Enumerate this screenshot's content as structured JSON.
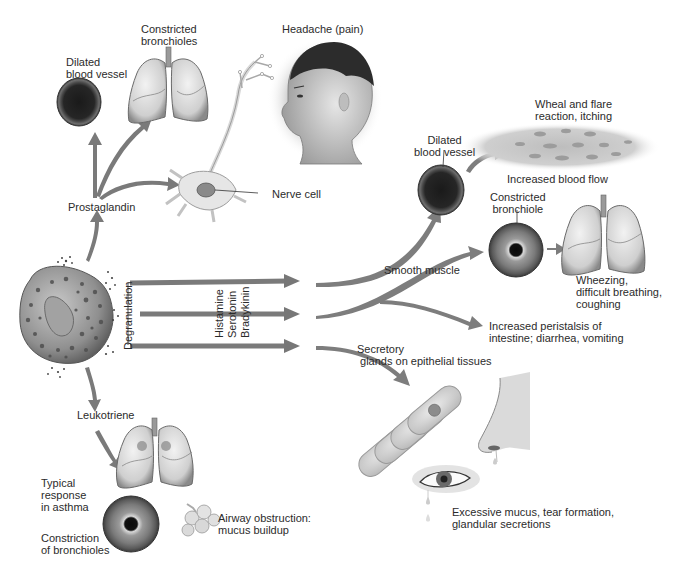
{
  "diagram": {
    "palette": {
      "arrow": "#7a7a7a",
      "arrow_dark": "#5e5e5e",
      "label_text": "#2b2b2b",
      "tissue_light": "#d9d9d9",
      "tissue_mid": "#a8a8a8",
      "tissue_dark": "#3c3c3c",
      "background": "#ffffff"
    },
    "source_cell": {
      "name": "Mast cell (granulated)",
      "process_label": "Degranulation"
    },
    "mediators": {
      "prostaglandin": "Prostaglandin",
      "leukotriene": "Leukotriene",
      "histamine": "Histamine",
      "serotonin": "Serotonin",
      "bradykinin": "Bradykinin"
    },
    "prostaglandin_effects": {
      "dilated_vessel": "Dilated\nblood vessel",
      "constricted_bronchioles": "Constricted\nbronchioles",
      "headache": "Headache (pain)",
      "nerve_cell": "Nerve cell"
    },
    "right_effects": {
      "dilated_vessel": "Dilated\nblood vessel",
      "wheal": "Wheal and flare\nreaction, itching",
      "blood_flow": "Increased blood flow",
      "constricted_bronchiole": "Constricted\nbronchiole",
      "smooth_muscle": "Smooth muscle",
      "wheezing": "Wheezing,\ndifficult breathing,\ncoughing",
      "peristalsis": "Increased peristalsis of\nintestine; diarrhea, vomiting",
      "secretory": "Secretory\n glands on epithelial tissues",
      "mucus": "Excessive mucus, tear formation,\nglandular secretions"
    },
    "leukotriene_effects": {
      "typical_response": "Typical\nresponse\nin asthma",
      "constriction": "Constriction\nof bronchioles",
      "airway_obstruction": "Airway obstruction:\nmucus buildup"
    }
  }
}
